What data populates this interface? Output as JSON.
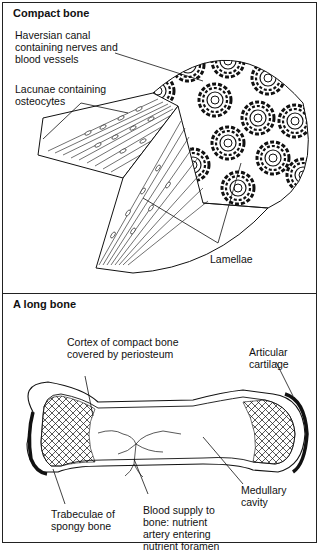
{
  "panels": {
    "compact": {
      "title": "Compact bone",
      "labels": {
        "haversian_1": "Haversian canal",
        "haversian_2": "containing nerves and",
        "haversian_3": "blood vessels",
        "lacunae_1": "Lacunae containing",
        "lacunae_2": "osteocytes",
        "lamellae": "Lamellae"
      }
    },
    "long": {
      "title": "A long bone",
      "labels": {
        "cortex_1": "Cortex of compact bone",
        "cortex_2": "covered by periosteum",
        "articular_1": "Articular",
        "articular_2": "cartilage",
        "trabeculae_1": "Trabeculae of",
        "trabeculae_2": "spongy bone",
        "blood_1": "Blood supply to",
        "blood_2": "bone: nutrient",
        "blood_3": "artery entering",
        "blood_4": "nutrient foramen",
        "medullary_1": "Medullary",
        "medullary_2": "cavity"
      }
    }
  },
  "colors": {
    "ink": "#111111",
    "border": "#222222",
    "background": "#ffffff"
  }
}
